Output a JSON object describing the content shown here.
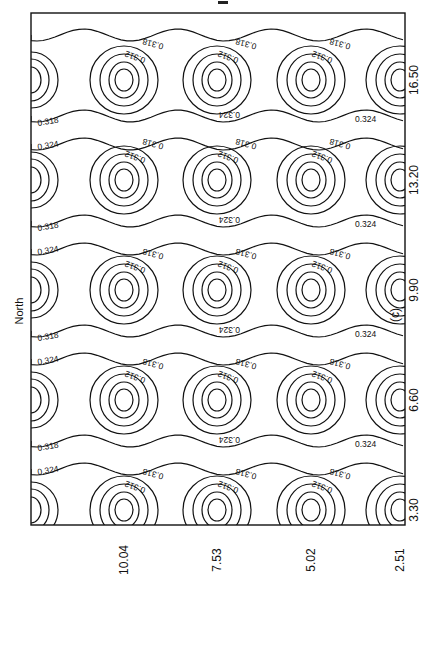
{
  "chart_data": {
    "type": "heatmap",
    "subtype": "contour",
    "title": "",
    "panel_label": "(c)",
    "orientation": "rotated 90 degrees counter-clockwise",
    "axis_label_left": "North",
    "x_ticks_bottom": [
      "10.04",
      "7.53",
      "5.02",
      "2.51"
    ],
    "y_ticks_right": [
      "16.50",
      "13.20",
      "9.90",
      "6.60",
      "3.30"
    ],
    "contour_levels": [
      0.312,
      0.318,
      0.324
    ],
    "contour_labels": [
      "0.312",
      "0.318",
      "0.324"
    ],
    "grid": false,
    "legend": null,
    "pattern": "periodic array of minima (~0.30) arranged in 5 rows by 4 columns, with 0.324 contours separating rows",
    "minima_centers": [
      {
        "row": "16.50",
        "cols": [
          "10.04",
          "7.53",
          "5.02",
          "2.51"
        ]
      },
      {
        "row": "13.20",
        "cols": [
          "10.04",
          "7.53",
          "5.02",
          "2.51"
        ]
      },
      {
        "row": "9.90",
        "cols": [
          "10.04",
          "7.53",
          "5.02",
          "2.51"
        ]
      },
      {
        "row": "6.60",
        "cols": [
          "10.04",
          "7.53",
          "5.02",
          "2.51"
        ]
      },
      {
        "row": "3.30",
        "cols": [
          "10.04",
          "7.53",
          "5.02",
          "2.51"
        ]
      }
    ]
  },
  "labels": {
    "north": "North",
    "caption": "(c)",
    "c312": "0.312",
    "c318": "0.318",
    "c324": "0.324"
  }
}
